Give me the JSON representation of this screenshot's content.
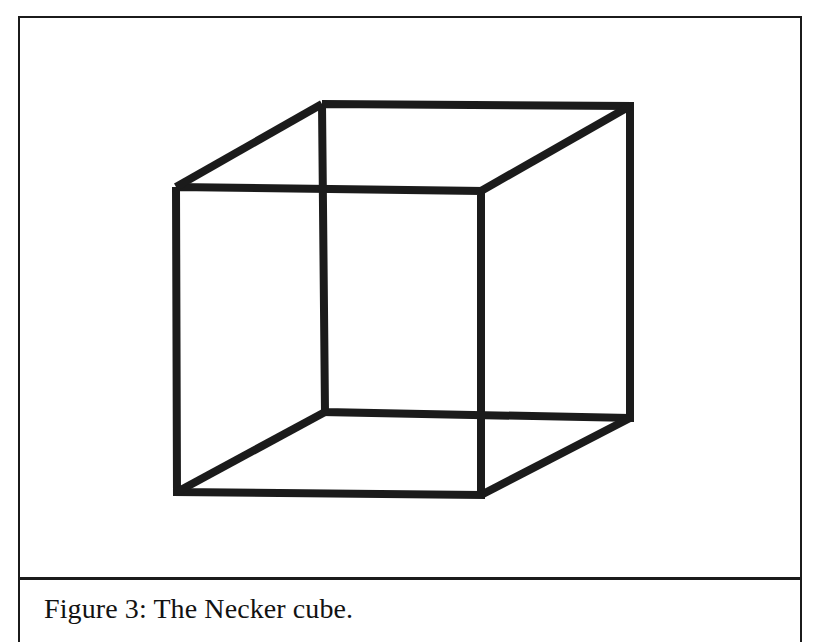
{
  "figure": {
    "caption": "Figure 3: The Necker cube.",
    "label": "Figure 3",
    "title": "The Necker cube",
    "alt": "Necker cube: a two-dimensional wireframe line drawing of a cube with no depth cues, producing a bistable ambiguous perception.",
    "page_background": "#ffffff",
    "frame_color": "#1b1b1b",
    "frame_rule_width_px": 2
  },
  "drawing": {
    "name": "necker-cube",
    "stroke_color": "#1b1b1b",
    "stroke_width_px": 8,
    "fill": "none",
    "viewbox": "0 0 780 559",
    "vertices": {
      "front_top_left": [
        156,
        169
      ],
      "front_top_right": [
        461,
        173
      ],
      "front_bottom_right": [
        461,
        477
      ],
      "front_bottom_left": [
        157,
        474
      ],
      "back_top_left": [
        302,
        86
      ],
      "back_top_right": [
        610,
        88
      ],
      "back_bottom_right": [
        610,
        400
      ],
      "back_bottom_left": [
        305,
        394
      ]
    },
    "edges": [
      {
        "name": "front-face",
        "points": "156,169 461,173 461,477 157,474 156,169"
      },
      {
        "name": "back-face",
        "points": "302,86 610,88 610,400 305,394 302,86"
      },
      {
        "name": "connector-top-left",
        "points": "156,169 302,86"
      },
      {
        "name": "connector-top-right",
        "points": "461,173 610,88"
      },
      {
        "name": "connector-bottom-right",
        "points": "461,477 610,400"
      },
      {
        "name": "connector-bottom-left",
        "points": "157,474 305,394"
      }
    ]
  },
  "chart_data": {
    "type": "diagram",
    "title": "Figure 3: The Necker cube.",
    "subtitle": "",
    "xlabel": "",
    "ylabel": "",
    "shape": "cube-wireframe",
    "vertex_count": 8,
    "edge_count": 12,
    "faces_drawn": 2,
    "connector_count": 4,
    "legend": [],
    "annotations": []
  }
}
